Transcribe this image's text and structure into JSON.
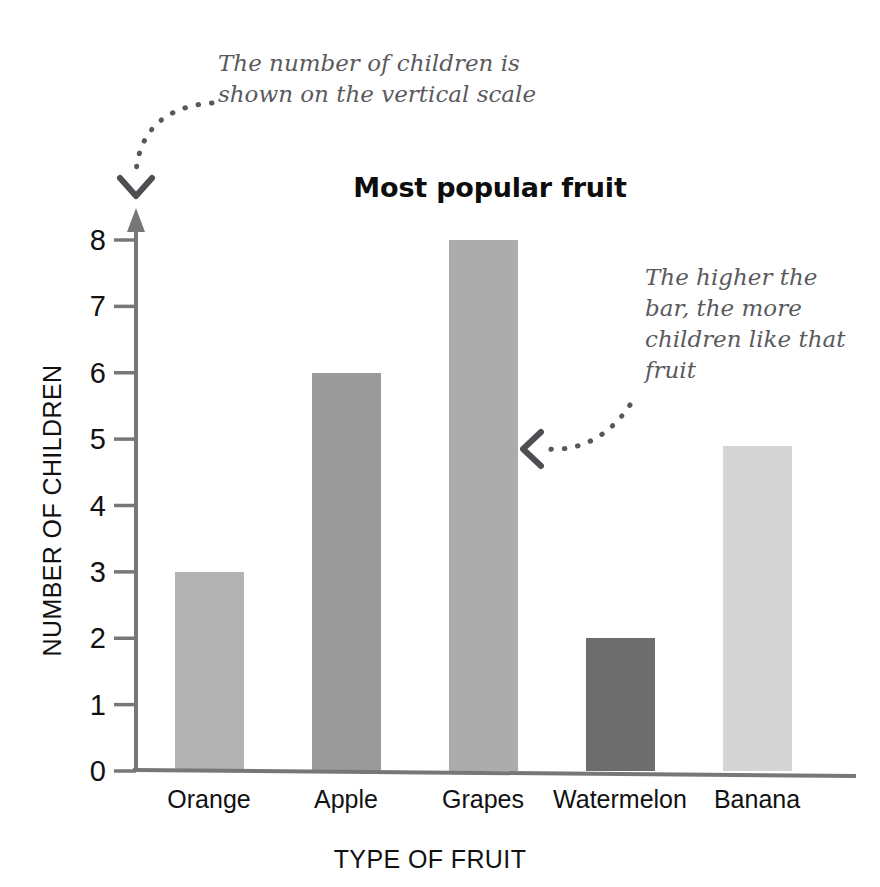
{
  "chart_data": {
    "type": "bar",
    "title": "Most popular fruit",
    "xlabel": "TYPE OF FRUIT",
    "ylabel": "NUMBER OF CHILDREN",
    "categories": [
      "Orange",
      "Apple",
      "Grapes",
      "Watermelon",
      "Banana"
    ],
    "values": [
      3,
      6,
      8,
      2,
      4.9
    ],
    "ylim": [
      0,
      8
    ],
    "ytick_labels": [
      "0",
      "1",
      "2",
      "3",
      "4",
      "5",
      "6",
      "7",
      "8"
    ],
    "yticks": [
      0,
      1,
      2,
      3,
      4,
      5,
      6,
      7,
      8
    ],
    "grid": false,
    "legend": "none",
    "bar_colors": [
      "#b3b3b3",
      "#9a9a9a",
      "#acacac",
      "#6d6d6d",
      "#d5d5d5"
    ],
    "axis_color": "#77777a",
    "annotations": [
      {
        "id": "vertical-scale",
        "text": "The number of children is shown on the vertical scale",
        "points_to": "y-axis",
        "arrow": "dotted-curved-down"
      },
      {
        "id": "bar-height",
        "text": "The higher the bar, the more children like that fruit",
        "points_to": "grapes-bar",
        "arrow": "dotted-curved-left"
      }
    ]
  },
  "chart": {
    "title": "Most popular fruit",
    "x_axis_title": "TYPE OF FRUIT",
    "y_axis_title": "NUMBER OF CHILDREN"
  },
  "annotations": {
    "vertical_scale": "The number of children is shown on the vertical scale",
    "bar_height": "The higher the bar, the more children like that fruit"
  },
  "icons": {
    "down_arrow": "dotted-down-arrow-icon",
    "left_arrow": "dotted-left-arrow-icon",
    "y_axis_arrowhead": "up-arrowhead-icon"
  }
}
